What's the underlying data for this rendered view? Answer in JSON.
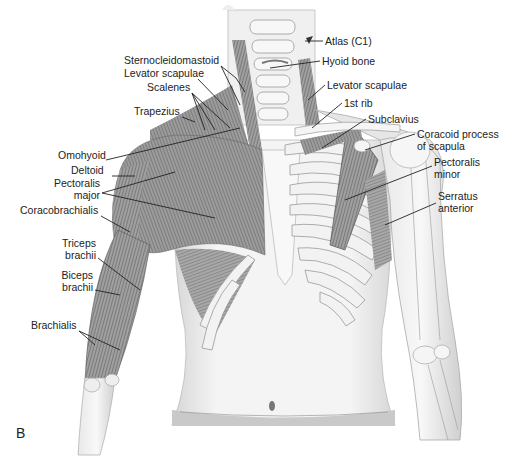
{
  "figure": {
    "panel_label": "B",
    "left_labels": [
      {
        "id": "sternocleidomastoid",
        "text": "Sternocleidomastoid",
        "x": 124,
        "y": 60,
        "align": "left"
      },
      {
        "id": "levator-scapulae-left",
        "text": "Levator scapulae",
        "x": 124,
        "y": 73,
        "align": "left"
      },
      {
        "id": "scalenes",
        "text": "Scalenes",
        "x": 147,
        "y": 87,
        "align": "left"
      },
      {
        "id": "trapezius",
        "text": "Trapezius",
        "x": 134,
        "y": 111,
        "align": "left"
      },
      {
        "id": "omohyoid",
        "text": "Omohyoid",
        "x": 58,
        "y": 155,
        "align": "left"
      },
      {
        "id": "deltoid",
        "text": "Deltoid",
        "x": 71,
        "y": 170,
        "align": "left"
      },
      {
        "id": "pectoralis-major",
        "text": "Pectoralis\nmajor",
        "x": 54,
        "y": 183,
        "align": "right",
        "w": 46
      },
      {
        "id": "coracobrachialis",
        "text": "Coracobrachialis",
        "x": 20,
        "y": 210,
        "align": "left"
      },
      {
        "id": "triceps-brachii",
        "text": "Triceps\nbrachii",
        "x": 62,
        "y": 243,
        "align": "right",
        "w": 34
      },
      {
        "id": "biceps-brachii",
        "text": "Biceps\nbrachii",
        "x": 60,
        "y": 275,
        "align": "right",
        "w": 33
      },
      {
        "id": "brachialis",
        "text": "Brachialis",
        "x": 31,
        "y": 325,
        "align": "left"
      }
    ],
    "right_labels": [
      {
        "id": "atlas-c1",
        "text": "Atlas (C1)",
        "x": 325,
        "y": 36,
        "align": "left"
      },
      {
        "id": "hyoid-bone",
        "text": "Hyoid bone",
        "x": 322,
        "y": 55,
        "align": "left"
      },
      {
        "id": "levator-scapulae-right",
        "text": "Levator scapulae",
        "x": 327,
        "y": 79,
        "align": "left"
      },
      {
        "id": "first-rib",
        "text": "1st rib",
        "x": 344,
        "y": 97,
        "align": "left"
      },
      {
        "id": "subclavius",
        "text": "Subclavius",
        "x": 368,
        "y": 113,
        "align": "left"
      },
      {
        "id": "coracoid-process",
        "text": "Coracoid process\nof scapula",
        "x": 417,
        "y": 128,
        "align": "left"
      },
      {
        "id": "pectoralis-minor",
        "text": "Pectoralis\nminor",
        "x": 434,
        "y": 156,
        "align": "left"
      },
      {
        "id": "serratus-anterior",
        "text": "Serratus\nanterior",
        "x": 438,
        "y": 190,
        "align": "left"
      }
    ],
    "colors": {
      "muscle_dark": "#5a5a5a",
      "muscle_mid": "#8a8a8a",
      "bone": "#ececec",
      "bone_outline": "#9a9a9a",
      "skin": "#f2f2f2",
      "skin_shadow": "#c8c8c8",
      "text": "#222222"
    }
  }
}
